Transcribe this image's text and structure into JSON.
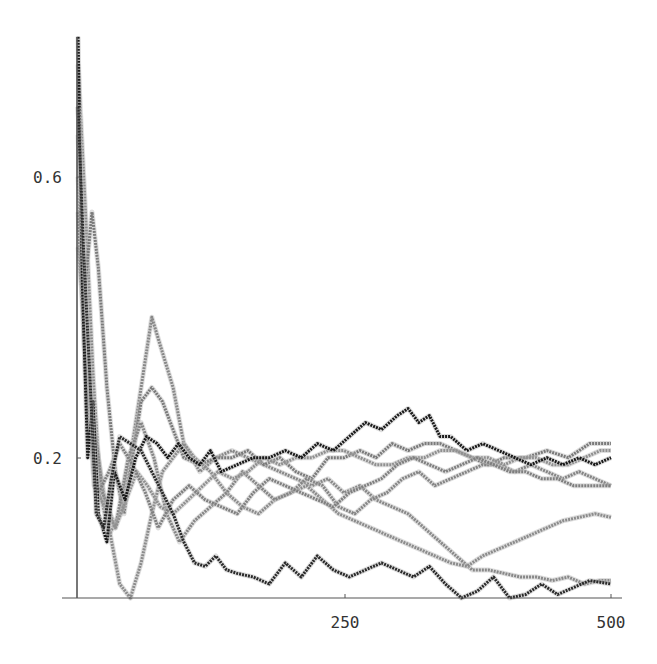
{
  "chart_data": {
    "type": "line",
    "title": "",
    "xlabel": "",
    "ylabel": "",
    "xlim": [
      0,
      500
    ],
    "ylim": [
      0,
      0.8
    ],
    "grid": false,
    "legend": "none",
    "x_ticks": [
      {
        "value": 250,
        "label": "250"
      },
      {
        "value": 500,
        "label": "500"
      }
    ],
    "y_ticks": [
      {
        "value": 0.2,
        "label": "0.2"
      },
      {
        "value": 0.6,
        "label": "0.6"
      }
    ],
    "series": [
      {
        "name": "black-1",
        "color": "#1a1a1a",
        "width": 3,
        "x": [
          1,
          5,
          10,
          15,
          20,
          28,
          35,
          45,
          55,
          65,
          75,
          85,
          95,
          105,
          115,
          125,
          135,
          150,
          165,
          180,
          195,
          210,
          225,
          240,
          255,
          270,
          285,
          300,
          310,
          320,
          330,
          340,
          350,
          365,
          380,
          395,
          410,
          425,
          440,
          455,
          470,
          485,
          500
        ],
        "y": [
          0.8,
          0.45,
          0.2,
          0.28,
          0.12,
          0.08,
          0.18,
          0.14,
          0.2,
          0.23,
          0.22,
          0.2,
          0.22,
          0.2,
          0.19,
          0.21,
          0.18,
          0.19,
          0.2,
          0.2,
          0.21,
          0.2,
          0.22,
          0.21,
          0.23,
          0.25,
          0.24,
          0.26,
          0.27,
          0.25,
          0.26,
          0.23,
          0.23,
          0.21,
          0.22,
          0.21,
          0.2,
          0.19,
          0.2,
          0.19,
          0.2,
          0.19,
          0.2
        ]
      },
      {
        "name": "black-2",
        "color": "#2a2a2a",
        "width": 3,
        "x": [
          1,
          6,
          12,
          18,
          25,
          32,
          40,
          50,
          60,
          70,
          80,
          90,
          100,
          110,
          120,
          130,
          140,
          150,
          165,
          180,
          195,
          210,
          225,
          240,
          255,
          270,
          285,
          300,
          315,
          330,
          345,
          360,
          375,
          390,
          405,
          420,
          435,
          450,
          465,
          480,
          500
        ],
        "y": [
          0.7,
          0.5,
          0.32,
          0.12,
          0.1,
          0.17,
          0.23,
          0.22,
          0.21,
          0.18,
          0.15,
          0.12,
          0.08,
          0.05,
          0.045,
          0.06,
          0.04,
          0.035,
          0.03,
          0.02,
          0.05,
          0.03,
          0.06,
          0.04,
          0.03,
          0.04,
          0.05,
          0.04,
          0.03,
          0.045,
          0.02,
          0.0,
          0.01,
          0.03,
          0.0,
          0.005,
          0.02,
          0.005,
          0.015,
          0.025,
          0.02
        ]
      },
      {
        "name": "gray-1",
        "color": "#888888",
        "width": 3,
        "x": [
          1,
          8,
          15,
          22,
          30,
          40,
          50,
          60,
          70,
          80,
          90,
          100,
          115,
          130,
          145,
          160,
          175,
          190,
          205,
          220,
          235,
          250,
          265,
          280,
          295,
          310,
          325,
          340,
          355,
          370,
          385,
          400,
          415,
          430,
          445,
          460,
          475,
          490,
          500
        ],
        "y": [
          0.76,
          0.55,
          0.32,
          0.15,
          0.09,
          0.12,
          0.2,
          0.3,
          0.4,
          0.35,
          0.3,
          0.22,
          0.18,
          0.2,
          0.21,
          0.2,
          0.19,
          0.18,
          0.17,
          0.16,
          0.17,
          0.15,
          0.16,
          0.14,
          0.13,
          0.12,
          0.1,
          0.08,
          0.06,
          0.04,
          0.04,
          0.035,
          0.03,
          0.03,
          0.025,
          0.03,
          0.02,
          0.025,
          0.025
        ]
      },
      {
        "name": "gray-2",
        "color": "#7a7a7a",
        "width": 3,
        "x": [
          1,
          6,
          14,
          20,
          28,
          36,
          44,
          52,
          60,
          70,
          80,
          90,
          100,
          115,
          130,
          145,
          160,
          175,
          190,
          205,
          220,
          235,
          250,
          265,
          280,
          295,
          310,
          325,
          340,
          355,
          370,
          385,
          400,
          420,
          440,
          460,
          480,
          500
        ],
        "y": [
          0.66,
          0.42,
          0.55,
          0.47,
          0.3,
          0.18,
          0.12,
          0.2,
          0.28,
          0.3,
          0.28,
          0.24,
          0.2,
          0.19,
          0.2,
          0.2,
          0.21,
          0.19,
          0.2,
          0.18,
          0.17,
          0.2,
          0.2,
          0.21,
          0.2,
          0.22,
          0.21,
          0.22,
          0.22,
          0.21,
          0.2,
          0.19,
          0.2,
          0.2,
          0.21,
          0.2,
          0.22,
          0.22
        ]
      },
      {
        "name": "gray-3",
        "color": "#8c8c8c",
        "width": 3,
        "x": [
          1,
          10,
          20,
          30,
          40,
          50,
          60,
          70,
          80,
          90,
          100,
          110,
          125,
          140,
          155,
          170,
          185,
          200,
          215,
          230,
          245,
          260,
          275,
          290,
          305,
          320,
          335,
          350,
          365,
          380,
          395,
          410,
          425,
          440,
          455,
          470,
          485,
          500
        ],
        "y": [
          0.6,
          0.3,
          0.2,
          0.1,
          0.02,
          0.0,
          0.05,
          0.12,
          0.18,
          0.2,
          0.22,
          0.2,
          0.18,
          0.15,
          0.13,
          0.12,
          0.14,
          0.15,
          0.16,
          0.14,
          0.12,
          0.11,
          0.1,
          0.09,
          0.08,
          0.07,
          0.06,
          0.05,
          0.045,
          0.06,
          0.07,
          0.08,
          0.09,
          0.1,
          0.11,
          0.115,
          0.12,
          0.115
        ]
      },
      {
        "name": "gray-4",
        "color": "#858585",
        "width": 3,
        "x": [
          1,
          12,
          24,
          36,
          48,
          60,
          72,
          84,
          96,
          110,
          125,
          140,
          155,
          170,
          185,
          200,
          215,
          230,
          245,
          260,
          275,
          290,
          305,
          320,
          335,
          350,
          365,
          380,
          395,
          410,
          425,
          440,
          455,
          470,
          485,
          500
        ],
        "y": [
          0.5,
          0.3,
          0.15,
          0.1,
          0.2,
          0.25,
          0.2,
          0.12,
          0.08,
          0.11,
          0.13,
          0.15,
          0.18,
          0.16,
          0.14,
          0.15,
          0.17,
          0.16,
          0.13,
          0.12,
          0.14,
          0.15,
          0.17,
          0.18,
          0.16,
          0.17,
          0.18,
          0.19,
          0.19,
          0.18,
          0.19,
          0.18,
          0.17,
          0.18,
          0.17,
          0.16
        ]
      },
      {
        "name": "gray-5",
        "color": "#909090",
        "width": 3,
        "x": [
          1,
          8,
          16,
          26,
          36,
          46,
          56,
          66,
          78,
          90,
          104,
          118,
          132,
          146,
          160,
          175,
          190,
          205,
          220,
          235,
          250,
          265,
          280,
          295,
          310,
          325,
          340,
          355,
          370,
          385,
          400,
          415,
          430,
          445,
          460,
          475,
          490,
          500
        ],
        "y": [
          0.7,
          0.35,
          0.16,
          0.13,
          0.1,
          0.14,
          0.18,
          0.16,
          0.13,
          0.12,
          0.14,
          0.16,
          0.18,
          0.17,
          0.18,
          0.2,
          0.19,
          0.2,
          0.2,
          0.21,
          0.21,
          0.2,
          0.19,
          0.19,
          0.2,
          0.2,
          0.21,
          0.21,
          0.2,
          0.2,
          0.19,
          0.2,
          0.2,
          0.19,
          0.19,
          0.2,
          0.21,
          0.21
        ]
      },
      {
        "name": "gray-6",
        "color": "#7f7f7f",
        "width": 3,
        "x": [
          1,
          10,
          20,
          30,
          40,
          52,
          64,
          76,
          90,
          105,
          120,
          135,
          150,
          165,
          180,
          195,
          210,
          225,
          240,
          255,
          270,
          285,
          300,
          315,
          330,
          345,
          360,
          375,
          390,
          405,
          420,
          435,
          450,
          465,
          480,
          500
        ],
        "y": [
          0.55,
          0.25,
          0.15,
          0.18,
          0.22,
          0.19,
          0.15,
          0.1,
          0.14,
          0.16,
          0.14,
          0.13,
          0.12,
          0.15,
          0.17,
          0.16,
          0.15,
          0.14,
          0.13,
          0.15,
          0.16,
          0.17,
          0.19,
          0.2,
          0.19,
          0.18,
          0.19,
          0.2,
          0.19,
          0.18,
          0.18,
          0.17,
          0.17,
          0.16,
          0.16,
          0.16
        ]
      }
    ]
  },
  "axes": {
    "x_tick_labels": [
      "250",
      "500"
    ],
    "y_tick_labels": [
      "0.2",
      "0.6"
    ]
  }
}
